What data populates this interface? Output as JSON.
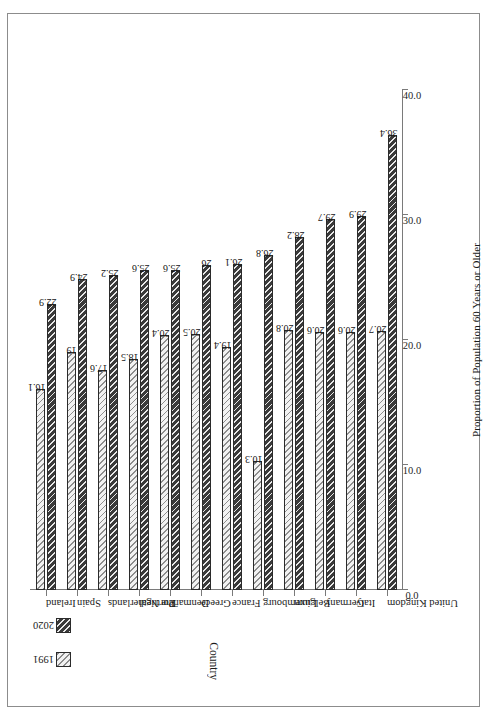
{
  "chart_data": {
    "type": "bar",
    "orientation": "horizontal",
    "title": "",
    "xlabel": "Proportion of Population 60 Years or Older",
    "ylabel": "Country",
    "xlim": [
      0.0,
      40.0
    ],
    "xticks": [
      "0.0",
      "10.0",
      "20.0",
      "30.0",
      "40.0"
    ],
    "grid": false,
    "legend_position": "top-left",
    "categories": [
      "Ireland",
      "Spain",
      "The Netherlands",
      "Portugal",
      "Denmark",
      "Greece",
      "France",
      "Luxembourg",
      "Belgium",
      "Germany",
      "Italy",
      "United Kingdom"
    ],
    "series": [
      {
        "name": "1991",
        "values": [
          16.1,
          19,
          17.6,
          18.5,
          20.4,
          20.5,
          19.4,
          10.3,
          20.8,
          20.6,
          20.6,
          20.7
        ],
        "labels": [
          "16.1",
          "19",
          "17.6",
          "18.5",
          "20.4",
          "20.5",
          "19.4",
          "10.3",
          "20.8",
          "20.6",
          "20.6",
          "20.7"
        ]
      },
      {
        "name": "2020",
        "values": [
          22.9,
          24.9,
          25.2,
          25.6,
          25.6,
          26,
          26.1,
          26.8,
          28.2,
          29.7,
          29.9,
          36.4
        ],
        "labels": [
          "22.9",
          "24.9",
          "25.2",
          "25.6",
          "25.6",
          "26",
          "26.1",
          "26.8",
          "28.2",
          "29.7",
          "29.9",
          "36.4"
        ]
      }
    ],
    "colors": {
      "series_1991_fill": "#f2f2f2",
      "series_1991_hatch": "#8d8d8d",
      "series_2020_fill": "#3a3a3a",
      "series_2020_hatch": "#e8e8e8",
      "axis": "#7a7a7a",
      "border": "#8c8c8c",
      "text": "#1a1a1a"
    }
  }
}
